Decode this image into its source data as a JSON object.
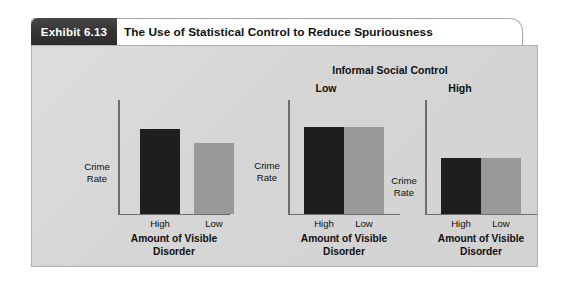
{
  "exhibit": {
    "tab_label": "Exhibit 6.13",
    "title": "The Use of Statistical Control to Reduce Spuriousness"
  },
  "group": {
    "header": "Informal Social Control",
    "low_label": "Low",
    "high_label": "High"
  },
  "chart_data": [
    {
      "type": "bar",
      "id": "zero-order",
      "title": "",
      "xlabel": "Amount of Visible Disorder",
      "ylabel": "Crime Rate",
      "ylabel_line1": "Crime",
      "ylabel_line2": "Rate",
      "xlabel_line1": "Amount of Visible",
      "xlabel_line2": "Disorder",
      "categories": [
        "High",
        "Low"
      ],
      "values": [
        85,
        71
      ],
      "colors": [
        "#1e1e1e",
        "#999999"
      ],
      "ylim": [
        0,
        115
      ],
      "grid": false,
      "legend": "none"
    },
    {
      "type": "bar",
      "id": "control-low",
      "title": "Low",
      "xlabel": "Amount of Visible Disorder",
      "ylabel": "Crime Rate",
      "ylabel_line1": "Crime",
      "ylabel_line2": "Rate",
      "xlabel_line1": "Amount of Visible",
      "xlabel_line2": "Disorder",
      "categories": [
        "High",
        "Low"
      ],
      "values": [
        87,
        87
      ],
      "colors": [
        "#1e1e1e",
        "#999999"
      ],
      "ylim": [
        0,
        115
      ],
      "grid": false,
      "legend": "none"
    },
    {
      "type": "bar",
      "id": "control-high",
      "title": "High",
      "xlabel": "Amount of Visible Disorder",
      "ylabel": "Crime Rate",
      "ylabel_line1": "Crime",
      "ylabel_line2": "Rate",
      "xlabel_line1": "Amount of Visible",
      "xlabel_line2": "Disorder",
      "categories": [
        "High",
        "Low"
      ],
      "values": [
        56,
        56
      ],
      "colors": [
        "#1e1e1e",
        "#999999"
      ],
      "ylim": [
        0,
        115
      ],
      "grid": false,
      "legend": "none"
    }
  ],
  "colors": {
    "bar_dark": "#1e1e1e",
    "bar_gray": "#999999",
    "panel_bg": "#d7d7d7",
    "tab_bg": "#333333",
    "axis": "#6d6d6d"
  }
}
